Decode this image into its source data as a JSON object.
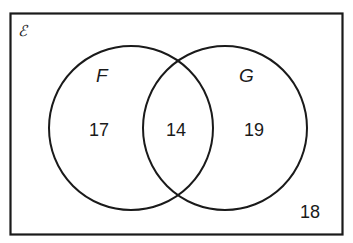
{
  "diagram": {
    "type": "venn",
    "universe_symbol": "ℰ",
    "sets": [
      {
        "name": "F",
        "only_count": "17"
      },
      {
        "name": "G",
        "only_count": "19"
      }
    ],
    "intersection_count": "14",
    "outside_count": "18"
  },
  "colors": {
    "stroke": "#1a1a1a",
    "background": "#ffffff"
  }
}
